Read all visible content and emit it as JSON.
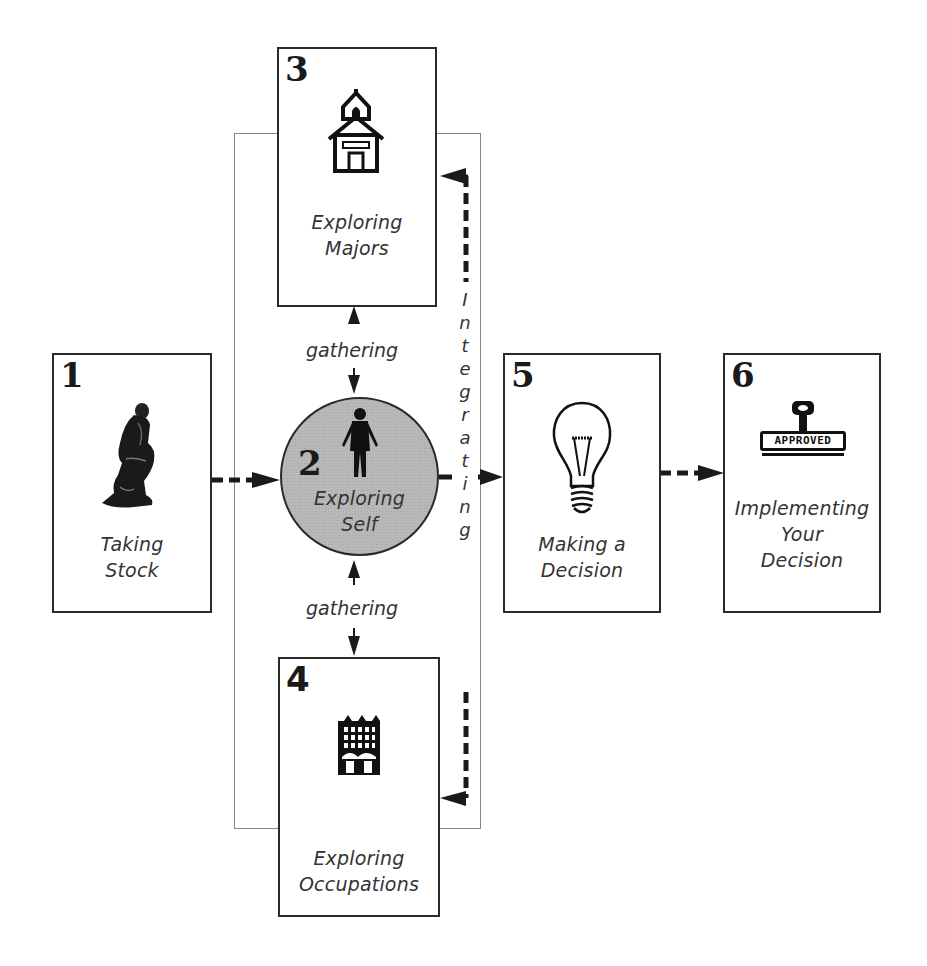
{
  "diagram": {
    "type": "process-flow",
    "steps": [
      {
        "number": "1",
        "label_lines": [
          "Taking",
          "Stock"
        ],
        "icon": "thinker-statue-icon"
      },
      {
        "number": "2",
        "label_lines": [
          "Exploring",
          "Self"
        ],
        "icon": "person-icon",
        "shape": "circle"
      },
      {
        "number": "3",
        "label_lines": [
          "Exploring",
          "Majors"
        ],
        "icon": "schoolhouse-icon"
      },
      {
        "number": "4",
        "label_lines": [
          "Exploring",
          "Occupations"
        ],
        "icon": "office-building-icon"
      },
      {
        "number": "5",
        "label_lines": [
          "Making a",
          "Decision"
        ],
        "icon": "lightbulb-icon"
      },
      {
        "number": "6",
        "label_lines": [
          "Implementing",
          "Your",
          "Decision"
        ],
        "icon": "approved-stamp-icon"
      }
    ],
    "connector_labels": {
      "gathering_top": "gathering",
      "gathering_bottom": "gathering",
      "integrating": [
        "I",
        "n",
        "t",
        "e",
        "g",
        "r",
        "a",
        "t",
        "i",
        "n",
        "g"
      ]
    },
    "stamp_text": "APPROVED",
    "edges": [
      {
        "from": "1",
        "to": "2",
        "style": "dashed-arrow"
      },
      {
        "from": "2",
        "to": "3",
        "style": "bidirectional-arrow",
        "label": "gathering"
      },
      {
        "from": "2",
        "to": "4",
        "style": "bidirectional-arrow",
        "label": "gathering"
      },
      {
        "from": "integrating",
        "to": "3",
        "style": "dashed-arrow"
      },
      {
        "from": "integrating",
        "to": "4",
        "style": "dashed-arrow"
      },
      {
        "from": "2",
        "to": "5",
        "style": "solid-arrow",
        "label": "integrating"
      },
      {
        "from": "5",
        "to": "6",
        "style": "dashed-arrow"
      }
    ],
    "colors": {
      "stroke": "#2a2a2a",
      "circle_fill": "#b8b8b8",
      "frame": "#888888"
    }
  }
}
